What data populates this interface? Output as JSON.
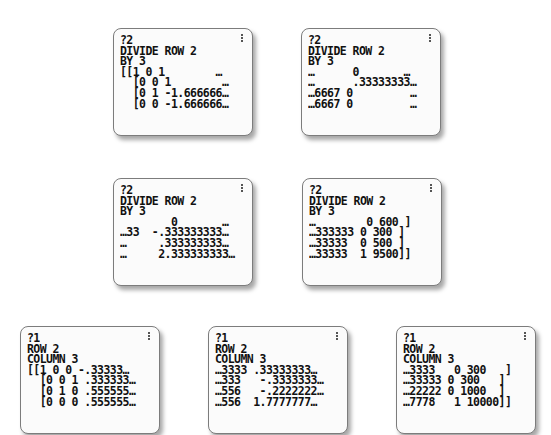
{
  "screens": [
    {
      "id": "s1",
      "position": {
        "left": 113,
        "top": 28
      },
      "lines": [
        "?2",
        "DIVIDE ROW 2",
        "BY 3",
        "[[1 0 1        …",
        "  [0 0 1        …",
        "  [0 1 -1.666666…",
        "  [0 0 -1.666666…"
      ]
    },
    {
      "id": "s2",
      "position": {
        "left": 301,
        "top": 28
      },
      "lines": [
        "?2",
        "DIVIDE ROW 2",
        "BY 3",
        "…      0       …",
        "…      .33333333…",
        "…6667 0         …",
        "…6667 0         …"
      ]
    },
    {
      "id": "s3",
      "position": {
        "left": 113,
        "top": 178
      },
      "lines": [
        "?2",
        "DIVIDE ROW 2",
        "BY 3",
        "        0       …",
        "…33  -.333333333…",
        "…     .333333333…",
        "…     2.333333333…"
      ]
    },
    {
      "id": "s4",
      "position": {
        "left": 302,
        "top": 178
      },
      "lines": [
        "?2",
        "DIVIDE ROW 2",
        "BY 3",
        "…        0 600 ]",
        "…333333 0 300 ]",
        "…33333  0 500 ]",
        "…33333  1 9500]]"
      ]
    },
    {
      "id": "s5",
      "position": {
        "left": 20,
        "top": 326
      },
      "lines": [
        "?1",
        "ROW 2",
        "COLUMN 3",
        "[[1 0 0 -.33333…",
        "  [0 0 1 .333333…",
        "  [0 1 0 .555555…",
        "  [0 0 0 .555555…"
      ]
    },
    {
      "id": "s6",
      "position": {
        "left": 208,
        "top": 326
      },
      "lines": [
        "?1",
        "ROW 2",
        "COLUMN 3",
        "…3333 .33333333…",
        "…333   -.3333333…",
        "…556   -.2222222…",
        "…556  1.7777777…"
      ]
    },
    {
      "id": "s7",
      "position": {
        "left": 396,
        "top": 326
      },
      "lines": [
        "?1",
        "ROW 2",
        "COLUMN 3",
        "…3333   0 300   ]",
        "…33333 0 300   ]",
        "…22222 0 1000  ]",
        "…7778   1 10000]]"
      ]
    }
  ]
}
